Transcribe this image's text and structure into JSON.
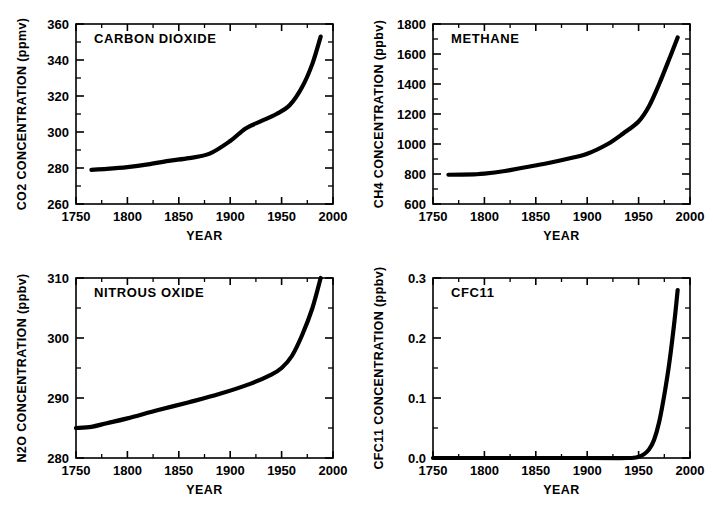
{
  "figure": {
    "panel_count": 4,
    "layout": "2x2 grid"
  },
  "chart_data": [
    {
      "type": "line",
      "title": "CARBON  DIOXIDE",
      "xlabel": "YEAR",
      "ylabel": "CO2  CONCENTRATION  (ppmv)",
      "xlim": [
        1750,
        2000
      ],
      "ylim": [
        260,
        360
      ],
      "xticks": [
        1750,
        1800,
        1850,
        1900,
        1950,
        2000
      ],
      "xtick_labels": [
        "1750",
        "1800",
        "1850",
        "1900",
        "1950",
        "2000"
      ],
      "yticks": [
        260,
        280,
        300,
        320,
        340,
        360
      ],
      "ytick_labels": [
        "260",
        "280",
        "300",
        "320",
        "340",
        "360"
      ],
      "x_minor_interval": 25,
      "y_minor_interval": 10,
      "grid": false,
      "legend": "none",
      "units": "ppmv",
      "series": [
        {
          "name": "CO2 concentration",
          "x": [
            1765,
            1780,
            1800,
            1820,
            1840,
            1860,
            1880,
            1900,
            1915,
            1930,
            1945,
            1958,
            1970,
            1980,
            1988
          ],
          "values": [
            279,
            279.5,
            280.5,
            282,
            284,
            285.5,
            288,
            295,
            302,
            306,
            310,
            315,
            325,
            338,
            353
          ]
        }
      ]
    },
    {
      "type": "line",
      "title": "METHANE",
      "xlabel": "YEAR",
      "ylabel": "CH4  CONCENTRATION  (ppbv)",
      "xlim": [
        1750,
        2000
      ],
      "ylim": [
        600,
        1800
      ],
      "xticks": [
        1750,
        1800,
        1850,
        1900,
        1950,
        2000
      ],
      "xtick_labels": [
        "1750",
        "1800",
        "1850",
        "1900",
        "1950",
        "2000"
      ],
      "yticks": [
        600,
        800,
        1000,
        1200,
        1400,
        1600,
        1800
      ],
      "ytick_labels": [
        "600",
        "800",
        "1000",
        "1200",
        "1400",
        "1600",
        "1800"
      ],
      "x_minor_interval": 25,
      "y_minor_interval": 100,
      "grid": false,
      "legend": "none",
      "units": "ppbv",
      "series": [
        {
          "name": "CH4 concentration",
          "x": [
            1765,
            1790,
            1800,
            1820,
            1840,
            1860,
            1880,
            1900,
            1920,
            1935,
            1950,
            1960,
            1970,
            1980,
            1988
          ],
          "values": [
            795,
            798,
            802,
            820,
            845,
            870,
            900,
            935,
            1000,
            1070,
            1150,
            1250,
            1400,
            1570,
            1710
          ]
        }
      ]
    },
    {
      "type": "line",
      "title": "NITROUS  OXIDE",
      "xlabel": "YEAR",
      "ylabel": "N2O  CONCENTRATION  (ppbv)",
      "xlim": [
        1750,
        2000
      ],
      "ylim": [
        280,
        310
      ],
      "xticks": [
        1750,
        1800,
        1850,
        1900,
        1950,
        2000
      ],
      "xtick_labels": [
        "1750",
        "1800",
        "1850",
        "1900",
        "1950",
        "2000"
      ],
      "yticks": [
        280,
        290,
        300,
        310
      ],
      "ytick_labels": [
        "280",
        "290",
        "300",
        "310"
      ],
      "x_minor_interval": 25,
      "y_minor_interval": 5,
      "grid": false,
      "legend": "none",
      "units": "ppbv",
      "series": [
        {
          "name": "N2O concentration",
          "x": [
            1750,
            1765,
            1780,
            1800,
            1830,
            1860,
            1890,
            1920,
            1940,
            1950,
            1960,
            1970,
            1980,
            1988
          ],
          "values": [
            285,
            285.2,
            285.8,
            286.6,
            288,
            289.3,
            290.7,
            292.4,
            293.9,
            295,
            297,
            300.5,
            305,
            310
          ]
        }
      ]
    },
    {
      "type": "line",
      "title": "CFC11",
      "xlabel": "YEAR",
      "ylabel": "CFC11  CONCENTRATION  (ppbv)",
      "xlim": [
        1750,
        2000
      ],
      "ylim": [
        0.0,
        0.3
      ],
      "xticks": [
        1750,
        1800,
        1850,
        1900,
        1950,
        2000
      ],
      "xtick_labels": [
        "1750",
        "1800",
        "1850",
        "1900",
        "1950",
        "2000"
      ],
      "yticks": [
        0.0,
        0.1,
        0.2,
        0.3
      ],
      "ytick_labels": [
        "0.0",
        "0.1",
        "0.2",
        "0.3"
      ],
      "x_minor_interval": 25,
      "y_minor_interval": 0.05,
      "grid": false,
      "legend": "none",
      "units": "ppbv",
      "series": [
        {
          "name": "CFC11 concentration",
          "x": [
            1750,
            1900,
            1940,
            1950,
            1955,
            1960,
            1965,
            1970,
            1975,
            1980,
            1985,
            1988
          ],
          "values": [
            0.0,
            0.0,
            0.0,
            0.002,
            0.006,
            0.014,
            0.03,
            0.06,
            0.105,
            0.16,
            0.23,
            0.28
          ]
        }
      ]
    }
  ],
  "colors": {
    "curve": "#000000",
    "axis": "#000000",
    "background": "#ffffff"
  }
}
